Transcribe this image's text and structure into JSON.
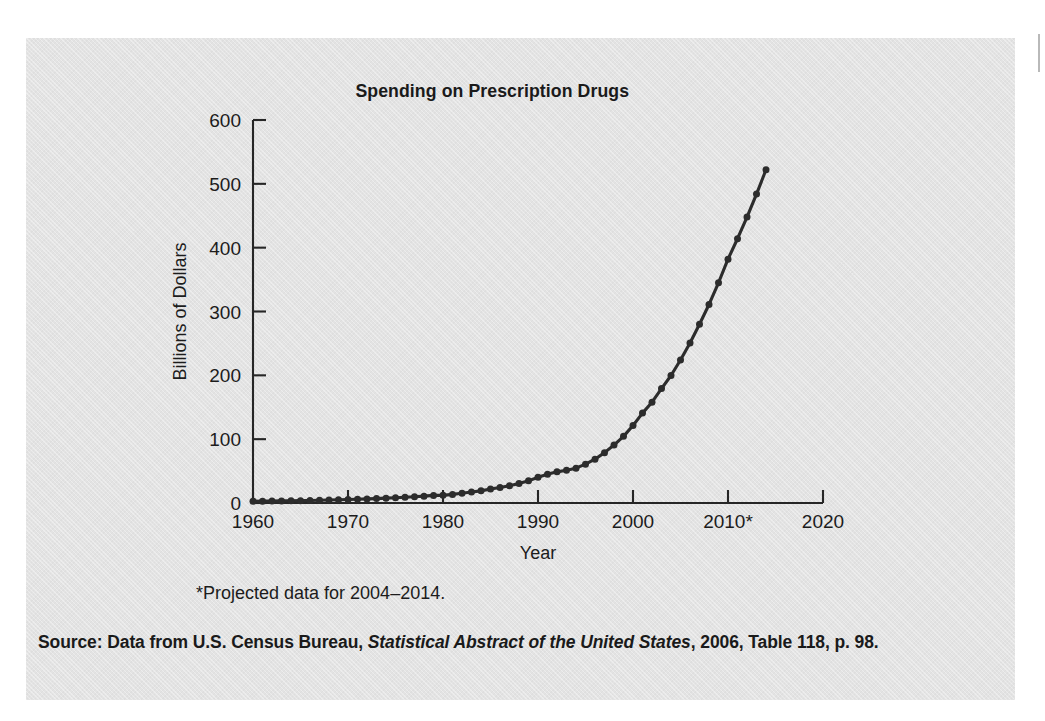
{
  "figure": {
    "panel_color": "#e3e3e3",
    "page_color": "#ffffff",
    "ink_color": "#2c2c2c"
  },
  "footnote": "*Projected data for 2004–2014.",
  "source": {
    "prefix": "Source: Data from U.S. Census Bureau, ",
    "publication": "Statistical Abstract of the United States",
    "suffix": ", 2006, Table 118, p. 98."
  },
  "chart_data": {
    "type": "line",
    "title": "Spending on Prescription Drugs",
    "xlabel": "Year",
    "ylabel": "Billions of Dollars",
    "xlim": [
      1960,
      2020
    ],
    "ylim": [
      0,
      600
    ],
    "xticks": [
      1960,
      1970,
      1980,
      1990,
      2000,
      2010,
      2020
    ],
    "xtick_labels": [
      "1960",
      "1970",
      "1980",
      "1990",
      "2000",
      "2010*",
      "2020"
    ],
    "yticks": [
      0,
      100,
      200,
      300,
      400,
      500,
      600
    ],
    "ytick_labels": [
      "0",
      "100",
      "200",
      "300",
      "400",
      "500",
      "600"
    ],
    "grid": false,
    "legend": "none",
    "marker": "circle",
    "annotations": [
      "*Projected data for 2004–2014."
    ],
    "series": [
      {
        "name": "Spending on prescription drugs",
        "x": [
          1960,
          1961,
          1962,
          1963,
          1964,
          1965,
          1966,
          1967,
          1968,
          1969,
          1970,
          1971,
          1972,
          1973,
          1974,
          1975,
          1976,
          1977,
          1978,
          1979,
          1980,
          1981,
          1982,
          1983,
          1984,
          1985,
          1986,
          1987,
          1988,
          1989,
          1990,
          1991,
          1992,
          1993,
          1994,
          1995,
          1996,
          1997,
          1998,
          1999,
          2000,
          2001,
          2002,
          2003,
          2004,
          2005,
          2006,
          2007,
          2008,
          2009,
          2010,
          2011,
          2012,
          2013,
          2014
        ],
        "values": [
          2.7,
          2.9,
          3.1,
          3.3,
          3.5,
          3.7,
          4.0,
          4.2,
          4.6,
          5.0,
          5.5,
          5.9,
          6.4,
          6.9,
          7.6,
          8.3,
          9.0,
          9.8,
          10.7,
          11.9,
          12.0,
          13.5,
          15.2,
          17.1,
          19.0,
          21.8,
          24.3,
          27.0,
          30.6,
          34.7,
          40.3,
          45.0,
          48.8,
          51.3,
          54.6,
          60.8,
          68.6,
          78.9,
          90.8,
          104.4,
          121.5,
          140.8,
          157.9,
          179.2,
          199.7,
          224.0,
          250.6,
          280.0,
          311.0,
          345.0,
          382.0,
          414.0,
          448.0,
          484.0,
          522.0
        ]
      }
    ]
  }
}
